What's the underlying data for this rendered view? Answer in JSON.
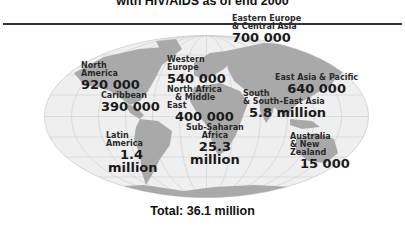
{
  "header": {
    "title": "with HIV/AIDS as of end 2000"
  },
  "regions": [
    {
      "name": "North America",
      "name_lines": [
        "North",
        "America"
      ],
      "value": "920 000"
    },
    {
      "name": "Caribbean",
      "name_lines": [
        "Caribbean"
      ],
      "value": "390 000"
    },
    {
      "name": "Western Europe",
      "name_lines": [
        "Western",
        "Europe"
      ],
      "value": "540 000"
    },
    {
      "name": "North Africa & Middle East",
      "name_lines": [
        "North Africa",
        "& Middle",
        "East"
      ],
      "value": "400 000"
    },
    {
      "name": "Eastern Europe & Central Asia",
      "name_lines": [
        "Eastern Europe",
        "& Central Asia"
      ],
      "value": "700 000"
    },
    {
      "name": "East Asia & Pacific",
      "name_lines": [
        "East Asia & Pacific"
      ],
      "value": "640 000"
    },
    {
      "name": "South & South-East Asia",
      "name_lines": [
        "South",
        "& South–East Asia"
      ],
      "value": "5.8 million"
    },
    {
      "name": "Sub-Saharan Africa",
      "name_lines": [
        "Sub-Saharan",
        "Africa"
      ],
      "value_lines": [
        "25.3",
        "million"
      ]
    },
    {
      "name": "Latin America",
      "name_lines": [
        "Latin",
        "America"
      ],
      "value_lines": [
        "1.4",
        "million"
      ]
    },
    {
      "name": "Australia & New Zealand",
      "name_lines": [
        "Australia",
        "& New",
        "Zealand"
      ],
      "value": "15 000"
    }
  ],
  "footer": {
    "total": "Total: 36.1 million"
  },
  "colors": {
    "ocean": "#f0f0f0",
    "land": "#a8a8a8",
    "grid": "#c8c8c8",
    "text": "#1a1a1a",
    "rule": "#333333"
  }
}
